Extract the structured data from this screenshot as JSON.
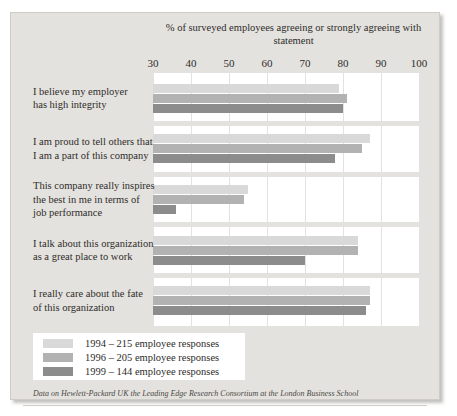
{
  "chart_data": {
    "type": "bar",
    "orientation": "horizontal",
    "title": "% of surveyed employees agreeing or strongly agreeing with statement",
    "xlabel": "",
    "ylabel": "",
    "xlim": [
      30,
      100
    ],
    "xticks": [
      30,
      40,
      50,
      60,
      70,
      80,
      90,
      100
    ],
    "grid": true,
    "legend_position": "bottom-left",
    "categories": [
      "I believe my employer has high integrity",
      "I am proud to tell others that I am a part of this company",
      "This company really inspires the best in me in terms of job performance",
      "I talk about this organization as a great place to work",
      "I really care about the fate of this organization"
    ],
    "series": [
      {
        "name": "1994 – 215 employee responses",
        "color": "#d9d9d9",
        "values": [
          79,
          87,
          55,
          84,
          87
        ]
      },
      {
        "name": "1996 – 205 employee responses",
        "color": "#b2b2b2",
        "values": [
          81,
          85,
          54,
          84,
          87
        ]
      },
      {
        "name": "1999 – 144 employee responses",
        "color": "#8c8c8c",
        "values": [
          80,
          78,
          36,
          70,
          86
        ]
      }
    ],
    "annotations": [
      "Data on Hewlett-Packard UK the Leading Edge Research Consortium at the London Business School"
    ]
  },
  "chart": {
    "title": "% of surveyed employees agreeing or strongly agreeing with statement",
    "footnote": "Data on Hewlett-Packard UK the Leading Edge Research Consortium at the London Business School",
    "category_lines": [
      [
        "I believe my employer",
        "has high integrity"
      ],
      [
        "I am proud to tell others that",
        "I am a part of this company"
      ],
      [
        "This company really inspires",
        "the best in me in terms of",
        "job performance"
      ],
      [
        "I talk about this organization",
        "as a great place to work"
      ],
      [
        "I really care about the fate",
        "of this organization"
      ]
    ]
  },
  "colors": {
    "background": "#e4e2de",
    "plot_background": "#ffffff",
    "series_1994": "#d9d9d9",
    "series_1996": "#b2b2b2",
    "series_1999": "#8c8c8c",
    "text": "#2e2c2a"
  }
}
